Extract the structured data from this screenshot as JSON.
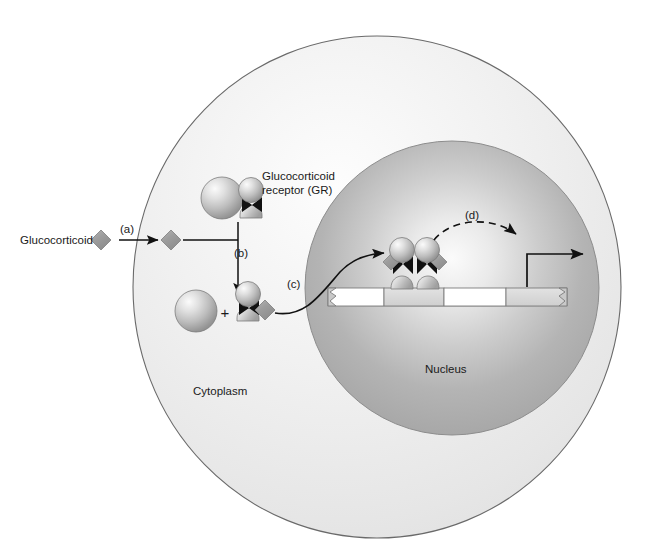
{
  "figure": {
    "type": "biological-pathway-diagram"
  },
  "labels": {
    "ligand": "Glucocorticoid",
    "receptor_line1": "Glucocorticoid",
    "receptor_line2": "receptor (GR)",
    "cytoplasm": "Cytoplasm",
    "nucleus": "Nucleus",
    "plus": "+"
  },
  "steps": [
    {
      "id": "a",
      "label": "(a)",
      "description": "Glucocorticoid crosses the plasma membrane into the cytoplasm"
    },
    {
      "id": "b",
      "label": "(b)",
      "description": "Ligand binds the GR complex causing dissociation of the chaperone"
    },
    {
      "id": "c",
      "label": "(c)",
      "description": "Activated ligand-receptor complex translocates into the nucleus and binds DNA"
    },
    {
      "id": "d",
      "label": "(d)",
      "description": "Bound receptor dimer activates transcription of the downstream gene"
    }
  ],
  "colors": {
    "outline": "#555555",
    "cell_fill_light": "#f2f2f2",
    "cell_fill_mid": "#e2e2e2",
    "nucleus_fill_light": "#f0f0f0",
    "nucleus_fill_mid": "#b8b8b8",
    "nucleus_fill_dark": "#a5a5a5",
    "ligand_fill": "#9a9a9a",
    "sphere_light": "#f5f5f5",
    "sphere_mid": "#c8c8c8",
    "sphere_dark": "#8a8a8a",
    "bowtie_fill": "#111111",
    "dna_white": "#ffffff",
    "dna_grey": "#d6d6d6",
    "arrow_stroke": "#111111",
    "text": "#1a1a1a"
  },
  "structures": {
    "cell": {
      "name": "cell-body",
      "shape": "ellipse"
    },
    "nucleus": {
      "name": "nucleus",
      "shape": "circle"
    },
    "dna": {
      "name": "dna-strand",
      "segments": [
        {
          "id": "seg-1",
          "shade": "white"
        },
        {
          "id": "seg-2-gre",
          "shade": "grey"
        },
        {
          "id": "seg-3",
          "shade": "white"
        },
        {
          "id": "seg-4-gene",
          "shade": "grey"
        }
      ],
      "left_end": "zigzag-break",
      "right_end": "zigzag-break"
    },
    "gr_complex_inactive": {
      "name": "gr-complex-inactive",
      "parts": [
        "chaperone-sphere",
        "receptor-sphere",
        "bowtie",
        "receptor-base"
      ]
    },
    "gr_complex_dissociated": {
      "name": "gr-complex-dissociated",
      "parts": [
        "chaperone-sphere",
        "ligand-bound-receptor"
      ]
    },
    "gr_dimer_on_dna": {
      "name": "gr-dimer-on-dna",
      "count": 2
    }
  }
}
